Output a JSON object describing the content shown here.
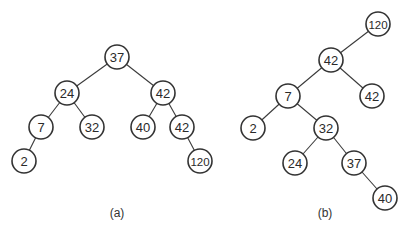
{
  "diagram": {
    "title": "",
    "trees": [
      {
        "id": "a",
        "caption": "(a)",
        "caption_pos": [
          117,
          217
        ],
        "nodes": [
          {
            "id": "a37",
            "label": "37",
            "x": 117,
            "y": 57
          },
          {
            "id": "a24",
            "label": "24",
            "x": 67,
            "y": 93
          },
          {
            "id": "a42",
            "label": "42",
            "x": 163,
            "y": 93
          },
          {
            "id": "a7",
            "label": "7",
            "x": 41,
            "y": 127
          },
          {
            "id": "a32",
            "label": "32",
            "x": 92,
            "y": 127
          },
          {
            "id": "a40",
            "label": "40",
            "x": 143,
            "y": 127
          },
          {
            "id": "a42b",
            "label": "42",
            "x": 182,
            "y": 127
          },
          {
            "id": "a2",
            "label": "2",
            "x": 24,
            "y": 161
          },
          {
            "id": "a120",
            "label": "120",
            "x": 200,
            "y": 161
          }
        ],
        "edges": [
          [
            "a37",
            "a24"
          ],
          [
            "a37",
            "a42"
          ],
          [
            "a24",
            "a7"
          ],
          [
            "a24",
            "a32"
          ],
          [
            "a42",
            "a40"
          ],
          [
            "a42",
            "a42b"
          ],
          [
            "a7",
            "a2"
          ],
          [
            "a42b",
            "a120"
          ]
        ]
      },
      {
        "id": "b",
        "caption": "(b)",
        "caption_pos": [
          325,
          217
        ],
        "nodes": [
          {
            "id": "b120",
            "label": "120",
            "x": 378,
            "y": 24
          },
          {
            "id": "b42",
            "label": "42",
            "x": 331,
            "y": 60
          },
          {
            "id": "b7",
            "label": "7",
            "x": 288,
            "y": 96
          },
          {
            "id": "b42b",
            "label": "42",
            "x": 372,
            "y": 96
          },
          {
            "id": "b2",
            "label": "2",
            "x": 253,
            "y": 128
          },
          {
            "id": "b32",
            "label": "32",
            "x": 326,
            "y": 128
          },
          {
            "id": "b24",
            "label": "24",
            "x": 295,
            "y": 163
          },
          {
            "id": "b37",
            "label": "37",
            "x": 354,
            "y": 163
          },
          {
            "id": "b40",
            "label": "40",
            "x": 385,
            "y": 198
          }
        ],
        "edges": [
          [
            "b120",
            "b42"
          ],
          [
            "b42",
            "b7"
          ],
          [
            "b42",
            "b42b"
          ],
          [
            "b7",
            "b2"
          ],
          [
            "b7",
            "b32"
          ],
          [
            "b32",
            "b24"
          ],
          [
            "b32",
            "b37"
          ],
          [
            "b37",
            "b40"
          ]
        ]
      }
    ],
    "node_radius": 12,
    "colors": {
      "stroke": "#333333",
      "fill": "#ffffff",
      "text": "#2a2a2a",
      "background": "#ffffff"
    }
  }
}
